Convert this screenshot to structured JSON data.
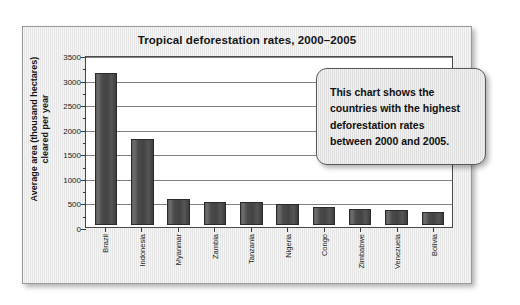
{
  "chart_data": {
    "type": "bar",
    "title": "Tropical deforestation rates, 2000–2005",
    "xlabel": "",
    "ylabel": "Average area (thousand hectares) cleared per year",
    "categories": [
      "Brazil",
      "Indonesia",
      "Myanmar",
      "Zambia",
      "Tanzania",
      "Nigeria",
      "Congo",
      "Zimbabwe",
      "Venezuela",
      "Bolivia"
    ],
    "values": [
      3100,
      1750,
      540,
      480,
      470,
      440,
      380,
      330,
      310,
      280
    ],
    "ylim": [
      0,
      3500
    ],
    "ytick_step": 500,
    "yticks": [
      0,
      500,
      1000,
      1500,
      2000,
      2500,
      3000,
      3500
    ],
    "ytick_labels": [
      "0",
      "500",
      "1000",
      "1500",
      "2000",
      "2500",
      "3000",
      "3500"
    ],
    "minor_tick_step": 250,
    "grid": true,
    "legend": false,
    "bar_color": "#4a4a4a",
    "plot_bg": "#ffffff",
    "frame_bg": "#e9e9e9",
    "annotations": [
      {
        "name": "callout",
        "text": "This chart shows the countries with the highest deforestation rates between 2000 and 2005."
      }
    ]
  },
  "callout": {
    "lines": [
      "This chart shows the",
      "countries with the highest",
      "deforestation rates",
      "between 2000 and 2005."
    ]
  },
  "axis": {
    "y_title_line1": "Average area (thousand hectares)",
    "y_title_line2": "cleared per year"
  }
}
